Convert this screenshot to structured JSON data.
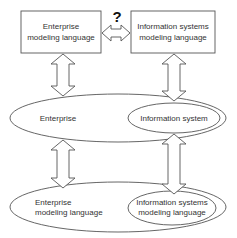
{
  "diagram": {
    "top_left_box": {
      "line1": "Enterprise",
      "line2": "modeling language"
    },
    "top_right_box": {
      "line1": "Information systems",
      "line2": "modeling language"
    },
    "question_mark": "?",
    "middle_outer_ellipse": {
      "label": "Enterprise"
    },
    "middle_inner_ellipse": {
      "label": "Information system"
    },
    "bottom_outer_ellipse": {
      "line1": "Enterprise",
      "line2": "modeling language"
    },
    "bottom_inner_ellipse": {
      "line1": "Information systems",
      "line2": "modeling language"
    },
    "colors": {
      "stroke": "#555555",
      "text": "#333333",
      "background": "#ffffff"
    }
  }
}
